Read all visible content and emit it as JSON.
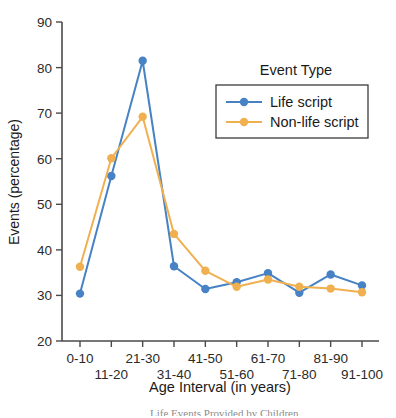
{
  "chart_data": {
    "type": "line",
    "title": "",
    "xlabel": "Age Interval (in years)",
    "ylabel": "Events (percentage)",
    "categories": [
      "0-10",
      "11-20",
      "21-30",
      "31-40",
      "41-50",
      "51-60",
      "61-70",
      "71-80",
      "81-90",
      "91-100"
    ],
    "ylim": [
      20,
      90
    ],
    "yticks": [
      20,
      30,
      40,
      50,
      60,
      70,
      80,
      90
    ],
    "ytick_labels": [
      "20",
      "30",
      "40",
      "50",
      "60",
      "70",
      "80",
      "90"
    ],
    "grid": false,
    "legend_position": "upper right",
    "legend_title": "Event Type",
    "series": [
      {
        "name": "Life script",
        "color": "#4682C4",
        "marker": "circle",
        "values": [
          30.4,
          56.2,
          81.5,
          36.4,
          31.4,
          32.9,
          34.9,
          30.6,
          34.6,
          32.2
        ]
      },
      {
        "name": "Non-life script",
        "color": "#F0B050",
        "marker": "circle",
        "values": [
          36.3,
          60.1,
          69.2,
          43.5,
          35.4,
          31.9,
          33.5,
          31.9,
          31.5,
          30.7
        ]
      }
    ]
  },
  "axes": {
    "y_axis_label": "Events (percentage)",
    "x_axis_label": "Age Interval (in years)"
  },
  "legend": {
    "title": "Event Type",
    "entries": [
      {
        "label": "Life script",
        "color": "#4682C4"
      },
      {
        "label": "Non-life script",
        "color": "#F0B050"
      }
    ]
  },
  "caption": {
    "clipped_text": "Life Events Provided by Children"
  }
}
